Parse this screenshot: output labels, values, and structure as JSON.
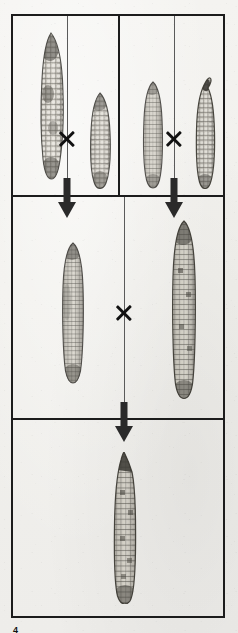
{
  "figure": {
    "page_number": "4",
    "caption": "",
    "ink_color": "#1c1c1c",
    "paper_color": "#f2f1ee",
    "cross_symbol": "×",
    "arrow_symbol": "↓"
  },
  "rows": [
    {
      "name": "parent-inbreds-row",
      "panels": [
        {
          "name": "cross-a-panel",
          "operator": "×",
          "ears": [
            {
              "name": "inbred-parent-a1",
              "label": "",
              "texture": "irregular-mottled",
              "length": "long"
            },
            {
              "name": "inbred-parent-a2",
              "label": "",
              "texture": "rough-pebbled",
              "length": "short"
            }
          ]
        },
        {
          "name": "cross-b-panel",
          "operator": "×",
          "ears": [
            {
              "name": "inbred-parent-b1",
              "label": "",
              "texture": "smooth-rowed",
              "length": "medium"
            },
            {
              "name": "inbred-parent-b2",
              "label": "",
              "texture": "dark-bent-tip",
              "length": "medium"
            }
          ]
        }
      ]
    },
    {
      "name": "f1-hybrids-row",
      "operator": "×",
      "ears": [
        {
          "name": "f1-hybrid-left",
          "label": "",
          "texture": "fine-rowed",
          "length": "medium"
        },
        {
          "name": "f1-hybrid-right",
          "label": "",
          "texture": "coarse-rowed",
          "length": "long"
        }
      ]
    },
    {
      "name": "double-cross-row",
      "ears": [
        {
          "name": "double-cross-hybrid",
          "label": "",
          "texture": "coarse-rowed-pointed",
          "length": "long"
        }
      ]
    }
  ],
  "connectors": [
    {
      "name": "arrow-cross-a-to-f1-left",
      "direction": "down"
    },
    {
      "name": "arrow-cross-b-to-f1-right",
      "direction": "down"
    },
    {
      "name": "arrow-f1-to-double-cross",
      "direction": "down"
    }
  ]
}
